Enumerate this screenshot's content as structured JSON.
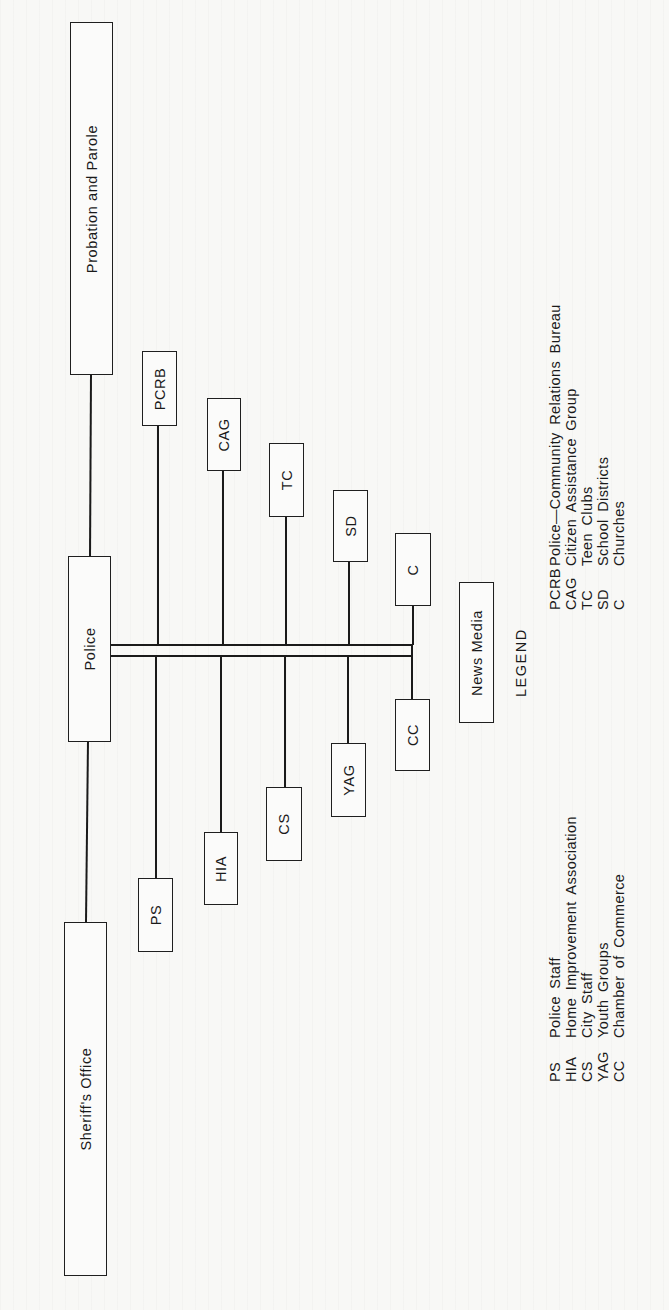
{
  "diagram": {
    "nodes": {
      "probation": "Probation and Parole",
      "police": "Police",
      "sheriff": "Sheriff's Office",
      "pcrb": "PCRB",
      "cag": "CAG",
      "tc": "TC",
      "sd": "SD",
      "c": "C",
      "ps": "PS",
      "hia": "HIA",
      "cs": "CS",
      "yag": "YAG",
      "cc": "CC",
      "news_media": "News Media"
    },
    "edges": [
      [
        "probation",
        "police"
      ],
      [
        "police",
        "sheriff"
      ],
      [
        "police",
        "pcrb"
      ],
      [
        "police",
        "cag"
      ],
      [
        "police",
        "tc"
      ],
      [
        "police",
        "sd"
      ],
      [
        "police",
        "c"
      ],
      [
        "police",
        "ps"
      ],
      [
        "police",
        "hia"
      ],
      [
        "police",
        "cs"
      ],
      [
        "police",
        "yag"
      ],
      [
        "police",
        "cc"
      ]
    ]
  },
  "legend": {
    "title": "LEGEND",
    "left_column": [
      {
        "abbr": "PS",
        "full": "Police Staff"
      },
      {
        "abbr": "HIA",
        "full": "Home Improvement Association"
      },
      {
        "abbr": "CS",
        "full": "City Staff"
      },
      {
        "abbr": "YAG",
        "full": "Youth Groups"
      },
      {
        "abbr": "CC",
        "full": "Chamber of Commerce"
      }
    ],
    "right_column": [
      {
        "abbr": "PCRB",
        "full": "Police—Community Relations Bureau"
      },
      {
        "abbr": "CAG",
        "full": "Citizen Assistance Group"
      },
      {
        "abbr": "TC",
        "full": "Teen Clubs"
      },
      {
        "abbr": "SD",
        "full": "School Districts"
      },
      {
        "abbr": "C",
        "full": "Churches"
      }
    ]
  }
}
